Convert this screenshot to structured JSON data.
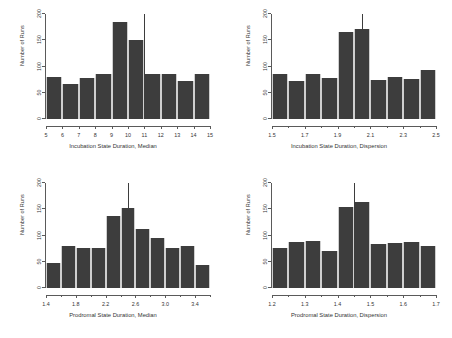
{
  "figure": {
    "ylabel": "Number of Runs",
    "bar_color": "#3d3d3d",
    "axis_color": "#5a5a5a",
    "background": "#ffffff"
  },
  "chart_data": [
    {
      "type": "bar",
      "title": "",
      "xlabel": "Incubation State Duration, Median",
      "ylabel": "Number of Runs",
      "xlim": [
        5,
        15
      ],
      "ylim": [
        0,
        200
      ],
      "ytick_labels": [
        "0",
        "50",
        "100",
        "150",
        "200"
      ],
      "ytick_values": [
        0,
        50,
        100,
        150,
        200
      ],
      "xtick_labels": [
        "5",
        "6",
        "7",
        "8",
        "9",
        "10",
        "11",
        "12",
        "13",
        "14",
        "15"
      ],
      "xtick_values": [
        5,
        6,
        7,
        8,
        9,
        10,
        11,
        12,
        13,
        14,
        15
      ],
      "bin_edges": [
        5,
        6,
        7,
        8,
        9,
        10,
        11,
        12,
        13,
        14,
        15
      ],
      "categories": [
        "5-6",
        "6-7",
        "7-8",
        "8-9",
        "9-10",
        "10-11",
        "11-12",
        "12-13",
        "13-14",
        "14-15"
      ],
      "values": [
        80,
        67,
        78,
        85,
        185,
        150,
        85,
        85,
        72,
        85
      ],
      "reference_line_x": 11,
      "grid": false,
      "legend": false
    },
    {
      "type": "bar",
      "title": "",
      "xlabel": "Incubation State Duration, Dispersion",
      "ylabel": "Number of Runs",
      "xlim": [
        1.5,
        2.5
      ],
      "ylim": [
        0,
        200
      ],
      "ytick_labels": [
        "0",
        "50",
        "100",
        "150",
        "200"
      ],
      "ytick_values": [
        0,
        50,
        100,
        150,
        200
      ],
      "xtick_labels": [
        "1.5",
        "1.7",
        "1.9",
        "2.1",
        "2.3",
        "2.5"
      ],
      "xtick_values": [
        1.5,
        1.7,
        1.9,
        2.1,
        2.3,
        2.5
      ],
      "bin_edges": [
        1.5,
        1.6,
        1.7,
        1.8,
        1.9,
        2.0,
        2.1,
        2.2,
        2.3,
        2.4,
        2.5
      ],
      "categories": [
        "1.5-1.6",
        "1.6-1.7",
        "1.7-1.8",
        "1.8-1.9",
        "1.9-2.0",
        "2.0-2.1",
        "2.1-2.2",
        "2.2-2.3",
        "2.3-2.4",
        "2.4-2.5"
      ],
      "values": [
        85,
        72,
        85,
        78,
        165,
        172,
        75,
        80,
        77,
        93
      ],
      "reference_line_x": 2.05,
      "grid": false,
      "legend": false
    },
    {
      "type": "bar",
      "title": "",
      "xlabel": "Prodromal State Duration, Median",
      "ylabel": "Number of Runs",
      "xlim": [
        1.4,
        3.6
      ],
      "ylim": [
        0,
        200
      ],
      "ytick_labels": [
        "0",
        "50",
        "100",
        "150",
        "200"
      ],
      "ytick_values": [
        0,
        50,
        100,
        150,
        200
      ],
      "xtick_labels": [
        "1.4",
        "1.8",
        "2.2",
        "2.6",
        "3.0",
        "3.4"
      ],
      "xtick_values": [
        1.4,
        1.8,
        2.2,
        2.6,
        3.0,
        3.4
      ],
      "bin_edges": [
        1.4,
        1.6,
        1.8,
        2.0,
        2.2,
        2.4,
        2.6,
        2.8,
        3.0,
        3.2,
        3.4,
        3.6
      ],
      "categories": [
        "1.4-1.6",
        "1.6-1.8",
        "1.8-2.0",
        "2.0-2.2",
        "2.2-2.4",
        "2.4-2.6",
        "2.6-2.8",
        "2.8-3.0",
        "3.0-3.2",
        "3.2-3.4",
        "3.4-3.6"
      ],
      "values": [
        47,
        80,
        77,
        77,
        137,
        152,
        113,
        95,
        77,
        80,
        43
      ],
      "reference_line_x": 2.5,
      "grid": false,
      "legend": false
    },
    {
      "type": "bar",
      "title": "",
      "xlabel": "Prodromal State Duration, Dispersion",
      "ylabel": "Number of Runs",
      "xlim": [
        1.2,
        1.7
      ],
      "ylim": [
        0,
        200
      ],
      "ytick_labels": [
        "0",
        "50",
        "100",
        "150",
        "200"
      ],
      "ytick_values": [
        0,
        50,
        100,
        150,
        200
      ],
      "xtick_labels": [
        "1.2",
        "1.3",
        "1.4",
        "1.5",
        "1.6",
        "1.7"
      ],
      "xtick_values": [
        1.2,
        1.3,
        1.4,
        1.5,
        1.6,
        1.7
      ],
      "bin_edges": [
        1.2,
        1.25,
        1.3,
        1.35,
        1.4,
        1.45,
        1.5,
        1.55,
        1.6,
        1.65,
        1.7
      ],
      "categories": [
        "1.20-1.25",
        "1.25-1.30",
        "1.30-1.35",
        "1.35-1.40",
        "1.40-1.45",
        "1.45-1.50",
        "1.50-1.55",
        "1.55-1.60",
        "1.60-1.65",
        "1.65-1.70"
      ],
      "values": [
        77,
        87,
        90,
        70,
        155,
        163,
        83,
        85,
        88,
        80
      ],
      "reference_line_x": 1.45,
      "grid": false,
      "legend": false
    }
  ]
}
